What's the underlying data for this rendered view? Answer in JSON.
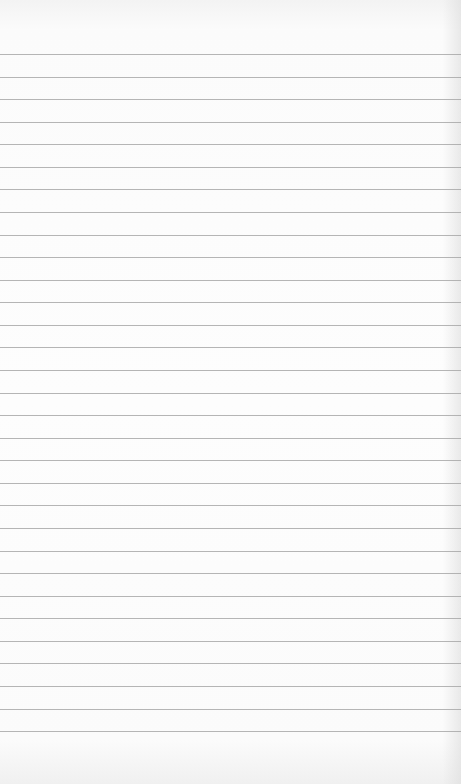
{
  "paper": {
    "type": "lined notebook paper",
    "background_color": "#fbfbfb",
    "rule_color": "#a8a8a8",
    "rule_count": 31,
    "first_rule_y": 54,
    "rule_spacing_px": 22.57,
    "text": ""
  }
}
